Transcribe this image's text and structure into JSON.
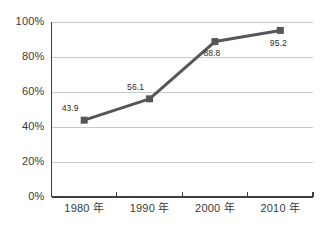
{
  "chart_data": {
    "type": "line",
    "title": "",
    "subtitle": "",
    "xlabel": "",
    "ylabel": "",
    "categories": [
      "1980 年",
      "1990 年",
      "2000 年",
      "2010 年"
    ],
    "values": [
      43.9,
      56.1,
      88.8,
      95.2
    ],
    "point_labels": [
      "43.9",
      "56.1",
      "88.8",
      "95.2"
    ],
    "ylim": [
      0,
      100
    ],
    "ytick_values": [
      0,
      20,
      40,
      60,
      80,
      100
    ],
    "ytick_labels": [
      "0%",
      "20%",
      "40%",
      "60%",
      "80%",
      "100%"
    ],
    "grid": "horizontal",
    "legend": "none",
    "series": [
      {
        "name": "",
        "values": [
          43.9,
          56.1,
          88.8,
          95.2
        ],
        "marker": "square",
        "line_color": "#565656",
        "marker_color": "#565656"
      }
    ],
    "colors": {
      "line": "#565656",
      "marker": "#565656",
      "gridline": "#c9c9c9",
      "axis": "#3f3f3f",
      "tick_text": "#3a3a3a",
      "label_text": "#2b2b2b",
      "background": "#ffffff"
    },
    "label_offsets": [
      {
        "dx": -14,
        "dy": -11
      },
      {
        "dx": -14,
        "dy": -11
      },
      {
        "dx": -3,
        "dy": 12
      },
      {
        "dx": -2,
        "dy": 13
      }
    ]
  }
}
